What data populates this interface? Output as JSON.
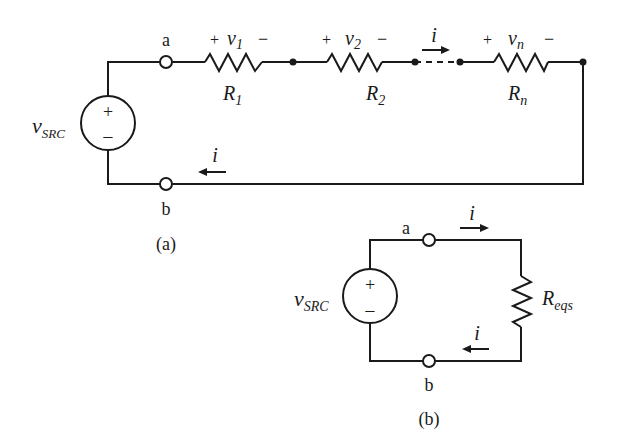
{
  "circuit_a": {
    "caption": "(a)",
    "source": {
      "label": "v",
      "label_sub": "SRC",
      "plus": "+",
      "minus": "−"
    },
    "node_a": "a",
    "node_b": "b",
    "resistors": [
      {
        "name": "R",
        "sub": "1",
        "volt": "v",
        "volt_sub": "1",
        "plus": "+",
        "minus": "−"
      },
      {
        "name": "R",
        "sub": "2",
        "volt": "v",
        "volt_sub": "2",
        "plus": "+",
        "minus": "−"
      },
      {
        "name": "R",
        "sub": "n",
        "volt": "v",
        "volt_sub": "n",
        "plus": "+",
        "minus": "−"
      }
    ],
    "current_top": "i",
    "current_bottom": "i"
  },
  "circuit_b": {
    "caption": "(b)",
    "source": {
      "label": "v",
      "label_sub": "SRC",
      "plus": "+",
      "minus": "−"
    },
    "node_a": "a",
    "node_b": "b",
    "resistor": {
      "name": "R",
      "sub": "eqs"
    },
    "current_top": "i",
    "current_bottom": "i"
  },
  "colors": {
    "ink": "#1a1a1a",
    "background": "#ffffff"
  }
}
